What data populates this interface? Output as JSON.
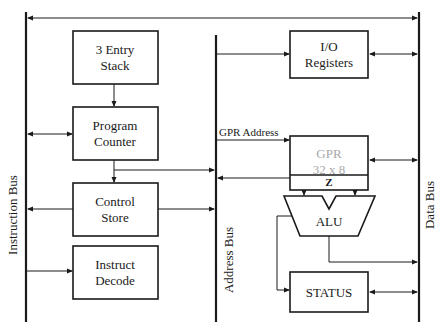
{
  "diagram": {
    "type": "microcontroller-architecture-block-diagram",
    "buses": {
      "instruction": "Instruction Bus",
      "address": "Address Bus",
      "data": "Data Bus"
    },
    "blocks": {
      "stack": {
        "line1": "3 Entry",
        "line2": "Stack"
      },
      "pc": {
        "line1": "Program",
        "line2": "Counter"
      },
      "control": {
        "line1": "Control",
        "line2": "Store"
      },
      "decode": {
        "line1": "Instruct",
        "line2": "Decode"
      },
      "io": {
        "line1": "I/O",
        "line2": "Registers"
      },
      "gpr": {
        "line1": "GPR",
        "line2": "32 x 8",
        "flag": "Z"
      },
      "alu": {
        "label": "ALU"
      },
      "status": {
        "label": "STATUS"
      }
    },
    "signals": {
      "gpr_address": "GPR Address"
    },
    "colors": {
      "line": "#1a1a1a",
      "faded_text": "#a8a8a8",
      "background": "#ffffff"
    }
  }
}
